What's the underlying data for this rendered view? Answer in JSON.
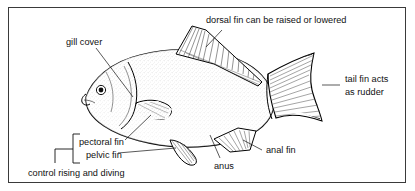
{
  "figure": {
    "border_color": "#3a3a3a",
    "background_color": "#ffffff",
    "ink_color": "#111111"
  },
  "labels": {
    "dorsal_fin": "dorsal fin can be raised or lowered",
    "gill_cover": "gill cover",
    "tail_fin_line1": "tail fin acts",
    "tail_fin_line2": "as rudder",
    "anal_fin": "anal fin",
    "anus": "anus",
    "pectoral_fin": "pectoral fin",
    "pelvic_fin": "pelvic fin",
    "bracket_caption": "control rising and diving"
  },
  "parts": [
    {
      "name": "gill-cover",
      "label": "gill cover"
    },
    {
      "name": "dorsal-fin",
      "label": "dorsal fin can be raised or lowered"
    },
    {
      "name": "tail-fin",
      "label": "tail fin acts as rudder"
    },
    {
      "name": "anal-fin",
      "label": "anal fin"
    },
    {
      "name": "anus",
      "label": "anus"
    },
    {
      "name": "pectoral-fin",
      "label": "pectoral fin"
    },
    {
      "name": "pelvic-fin",
      "label": "pelvic fin"
    }
  ]
}
